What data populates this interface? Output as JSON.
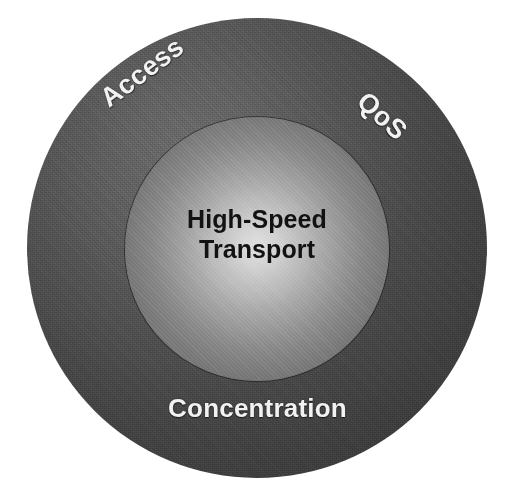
{
  "diagram": {
    "type": "concentric-circles",
    "background_color": "#ffffff",
    "core": {
      "name": "core-circle",
      "label_line_1": "High-Speed",
      "label_line_2": "Transport",
      "text_color": "#121212",
      "fill_center_color": "#e2e2e2",
      "fill_edge_color": "#666666",
      "center_x": 257,
      "center_y": 249,
      "radius": 132
    },
    "ring": {
      "name": "outer-ring",
      "fill_light_color": "#6d6d6d",
      "fill_dark_color": "#343434",
      "text_color": "#f2f2f2",
      "center_x": 257,
      "center_y": 248,
      "radius": 230,
      "labels": [
        {
          "id": "access",
          "text": "Access",
          "position": "upper-left",
          "rotation_deg": -37
        },
        {
          "id": "qos",
          "text": "QoS",
          "position": "upper-right",
          "rotation_deg": 42
        },
        {
          "id": "concentration",
          "text": "Concentration",
          "position": "bottom",
          "rotation_deg": 0
        }
      ]
    }
  }
}
